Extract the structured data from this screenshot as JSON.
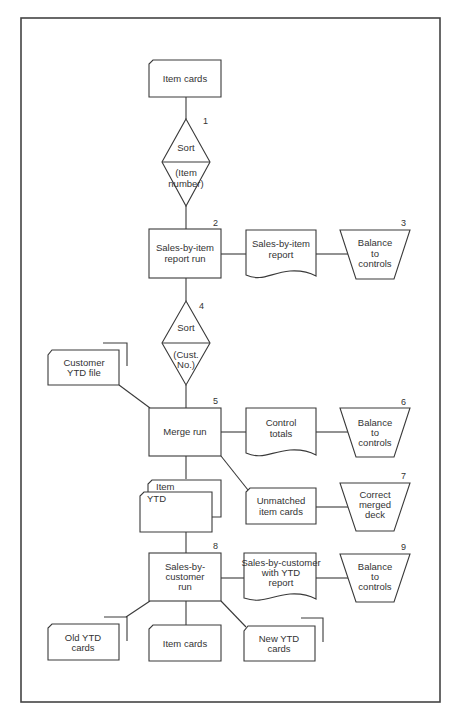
{
  "nodes": {
    "item_cards_top": {
      "lines": [
        "Item cards"
      ]
    },
    "sort1": {
      "num": "1",
      "top": "Sort",
      "bottom": [
        "(Item",
        "number)"
      ]
    },
    "report_run": {
      "num": "2",
      "lines": [
        "Sales-by-item",
        "report run"
      ]
    },
    "report_doc": {
      "lines": [
        "Sales-by-item",
        "report"
      ]
    },
    "balance3": {
      "num": "3",
      "lines": [
        "Balance",
        "to",
        "controls"
      ]
    },
    "sort4": {
      "num": "4",
      "top": "Sort",
      "bottom": [
        "(Cust.",
        "No.)"
      ]
    },
    "customer_ytd": {
      "lines": [
        "Customer",
        "YTD file"
      ]
    },
    "merge_run": {
      "num": "5",
      "lines": [
        "Merge run"
      ]
    },
    "control_totals": {
      "lines": [
        "Control",
        "totals"
      ]
    },
    "balance6": {
      "num": "6",
      "lines": [
        "Balance",
        "to",
        "controls"
      ]
    },
    "item_ytd": {
      "back": "Item",
      "front": "YTD"
    },
    "unmatched": {
      "lines": [
        "Unmatched",
        "item cards"
      ]
    },
    "correct7": {
      "num": "7",
      "lines": [
        "Correct",
        "merged",
        "deck"
      ]
    },
    "cust_run": {
      "num": "8",
      "lines": [
        "Sales-by-",
        "customer",
        "run"
      ]
    },
    "cust_report": {
      "lines": [
        "Sales-by-customer",
        "with YTD",
        "report"
      ]
    },
    "balance9": {
      "num": "9",
      "lines": [
        "Balance",
        "to",
        "controls"
      ]
    },
    "old_ytd": {
      "lines": [
        "Old YTD",
        "cards"
      ]
    },
    "item_cards_bottom": {
      "lines": [
        "Item cards"
      ]
    },
    "new_ytd": {
      "lines": [
        "New YTD",
        "cards"
      ]
    }
  }
}
